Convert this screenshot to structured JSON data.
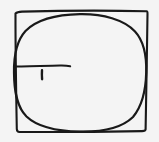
{
  "figure": {
    "title": "Hand-drawn circle inscribed in a square",
    "medium": "pencil sketch",
    "background_color": "#f4f4f4",
    "ink_color": "#191919",
    "canvas": {
      "width": 159,
      "height": 142
    },
    "shapes": {
      "square": {
        "name": "square",
        "label": "square",
        "corners": {
          "top_left": "15,13",
          "top_right": "147,11",
          "bottom_right": "145,130",
          "bottom_left": "17,132"
        },
        "path": "M 15.5 13.5 C 16.5 12.5 18 11.8 22 11.6 C 60 10.6 110 10.4 146.5 11.2 C 147.4 11.3 147.6 12.2 147.5 14 C 147.0 52 146.2 95 145.6 129.4 C 145.5 130.6 144.6 131.0 142.0 131.1 C 106 131.8 55 132.2 19.5 132.0 C 17.6 131.9 16.9 131.2 16.8 129.0 C 16.2 96 15.4 52 15.5 13.5 Z"
      },
      "circle": {
        "name": "inscribed-circle",
        "label": "inscribed circle",
        "center": "80,71",
        "radius_x": 65,
        "radius_y": 59,
        "path": "M 80 14.2 C 103 13.8 124 19.8 135 31.5 C 145 42.3 146.6 58 146.2 72.5 C 145.8 89 143 105 133 117 C 121.5 128.2 101 132.0 80 131.6 C 59 131.2 38 127.5 26.5 116.5 C 16.0 106 14.2 89 14.0 72.5 C 13.8 58 15.5 42.0 25.5 31.0 C 37.0 19.5 57 14.6 80 14.2 Z"
      },
      "radius_line": {
        "name": "radius-line",
        "label": "radius",
        "from": "15,66",
        "to": "70,66",
        "path": "M 15.2 66.6 C 28 66.0 48 65.8 60 65.6 C 65 65.5 68 65.8 70.2 66.2"
      },
      "tick_mark": {
        "name": "tick-mark",
        "label": "tick mark",
        "from": "42,70",
        "to": "42,79",
        "path": "M 42.0 70.3 C 41.8 73.0 41.9 76.5 42.1 79.2"
      }
    }
  }
}
